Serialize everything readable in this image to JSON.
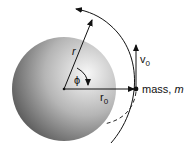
{
  "diagram": {
    "labels": {
      "r": "r",
      "phi": "ϕ",
      "r0": "r",
      "r0_sub": "0",
      "v0": "v",
      "v0_sub": "0",
      "mass": "mass, ",
      "mass_m": "m"
    },
    "colors": {
      "sphere_light": "#f4f4f4",
      "sphere_dark": "#4a4a4a",
      "line": "#111111"
    }
  }
}
